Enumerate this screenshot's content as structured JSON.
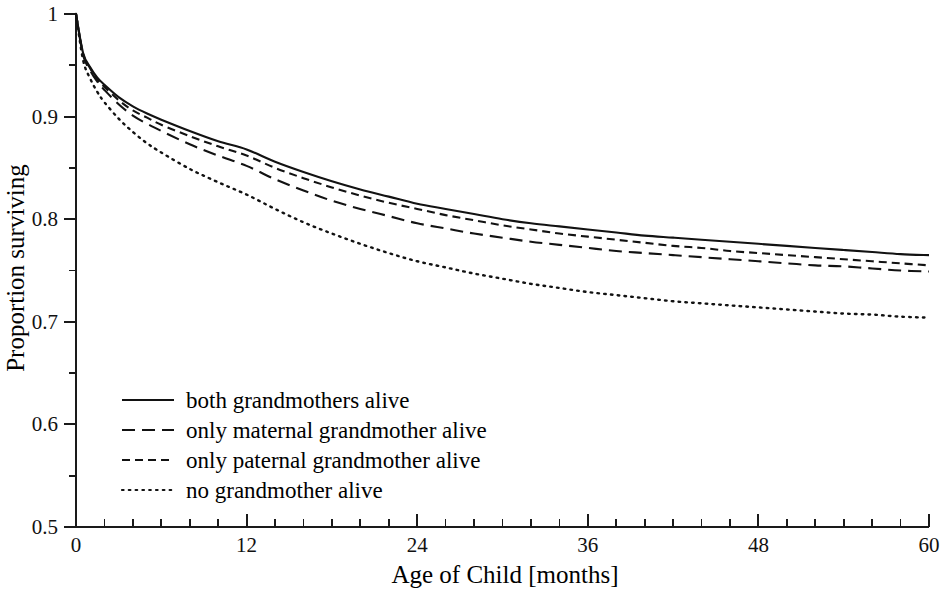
{
  "chart_data": {
    "type": "line",
    "title": "",
    "xlabel": "Age of Child [months]",
    "ylabel": "Proportion surviving",
    "xlim": [
      0,
      60
    ],
    "ylim": [
      0.5,
      1.0
    ],
    "grid": false,
    "legend_position": "lower-left-inside",
    "x_ticks_major": [
      0,
      12,
      24,
      36,
      48,
      60
    ],
    "x_tick_labels": [
      "0",
      "12",
      "24",
      "36",
      "48",
      "60"
    ],
    "x_tick_minor_step": 2,
    "y_ticks_major": [
      0.5,
      0.6,
      0.7,
      0.8,
      0.9,
      1.0
    ],
    "y_tick_labels": [
      "0.5",
      "0.6",
      "0.7",
      "0.8",
      "0.9",
      "1"
    ],
    "y_ticks_minor": [
      0.55,
      0.65,
      0.75,
      0.85,
      0.95
    ],
    "x": [
      0,
      0.5,
      1,
      1.5,
      2,
      3,
      4,
      5,
      6,
      8,
      10,
      12,
      14,
      16,
      18,
      20,
      22,
      24,
      26,
      28,
      30,
      32,
      34,
      36,
      38,
      40,
      42,
      44,
      46,
      48,
      50,
      52,
      54,
      56,
      58,
      60
    ],
    "series": [
      {
        "name": "both grandmothers alive",
        "style": "solid",
        "values": [
          1.0,
          0.962,
          0.948,
          0.938,
          0.931,
          0.919,
          0.91,
          0.903,
          0.897,
          0.886,
          0.876,
          0.868,
          0.856,
          0.846,
          0.837,
          0.829,
          0.822,
          0.815,
          0.81,
          0.805,
          0.8,
          0.796,
          0.793,
          0.79,
          0.787,
          0.784,
          0.782,
          0.78,
          0.778,
          0.776,
          0.774,
          0.772,
          0.77,
          0.768,
          0.766,
          0.765
        ]
      },
      {
        "name": "only maternal grandmother alive",
        "style": "long-dash",
        "values": [
          1.0,
          0.96,
          0.945,
          0.934,
          0.926,
          0.912,
          0.901,
          0.893,
          0.886,
          0.873,
          0.862,
          0.852,
          0.839,
          0.828,
          0.818,
          0.81,
          0.803,
          0.796,
          0.791,
          0.786,
          0.782,
          0.778,
          0.775,
          0.772,
          0.769,
          0.767,
          0.765,
          0.763,
          0.761,
          0.759,
          0.757,
          0.755,
          0.754,
          0.752,
          0.75,
          0.749
        ]
      },
      {
        "name": "only paternal grandmother alive",
        "style": "short-dash",
        "values": [
          1.0,
          0.961,
          0.947,
          0.936,
          0.929,
          0.916,
          0.906,
          0.899,
          0.892,
          0.881,
          0.871,
          0.862,
          0.85,
          0.84,
          0.831,
          0.823,
          0.816,
          0.81,
          0.804,
          0.799,
          0.794,
          0.79,
          0.786,
          0.783,
          0.78,
          0.777,
          0.774,
          0.772,
          0.769,
          0.767,
          0.765,
          0.763,
          0.761,
          0.759,
          0.757,
          0.755
        ]
      },
      {
        "name": "no grandmother alive",
        "style": "dotted",
        "values": [
          1.0,
          0.955,
          0.937,
          0.924,
          0.914,
          0.898,
          0.885,
          0.874,
          0.865,
          0.849,
          0.836,
          0.824,
          0.81,
          0.797,
          0.786,
          0.776,
          0.767,
          0.759,
          0.753,
          0.747,
          0.742,
          0.737,
          0.733,
          0.729,
          0.726,
          0.723,
          0.72,
          0.718,
          0.716,
          0.714,
          0.712,
          0.71,
          0.708,
          0.707,
          0.705,
          0.704
        ]
      }
    ]
  },
  "legend": {
    "entries": [
      {
        "label": "both grandmothers alive",
        "style": "solid"
      },
      {
        "label": "only maternal grandmother alive",
        "style": "long-dash"
      },
      {
        "label": "only paternal grandmother alive",
        "style": "short-dash"
      },
      {
        "label": "no grandmother alive",
        "style": "dotted"
      }
    ]
  },
  "colors": {
    "ink": "#121212",
    "axis": "#1a1a1a",
    "background": "#ffffff"
  }
}
